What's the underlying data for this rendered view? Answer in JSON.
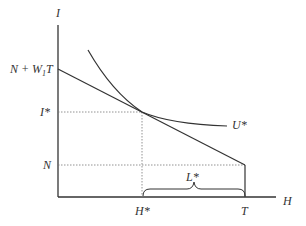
{
  "diagram": {
    "type": "labor-leisure-choice",
    "axes": {
      "y_label": "I",
      "x_label": "H"
    },
    "y_ticks": [
      {
        "label": "N + W",
        "sub": "1",
        "tail": "T",
        "id": "n-plus-w1t"
      },
      {
        "label": "I*",
        "id": "i-star"
      },
      {
        "label": "N",
        "id": "n"
      }
    ],
    "x_ticks": [
      {
        "label": "H*",
        "id": "h-star"
      },
      {
        "label": "T",
        "id": "t"
      }
    ],
    "curve_labels": {
      "indifference": "U*",
      "brace": "L*"
    },
    "colors": {
      "line": "#333333",
      "dotted": "#777777",
      "background": "#ffffff"
    }
  }
}
